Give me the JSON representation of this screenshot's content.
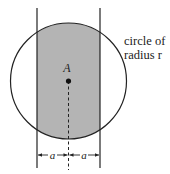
{
  "diagram": {
    "point_label": "A",
    "annotation_line1": "circle of",
    "annotation_line2": "radius r",
    "dim_left": "a",
    "dim_right": "a",
    "colors": {
      "shaded_region": "#b4b4b4",
      "stroke": "#222222",
      "background": "#ffffff"
    }
  }
}
